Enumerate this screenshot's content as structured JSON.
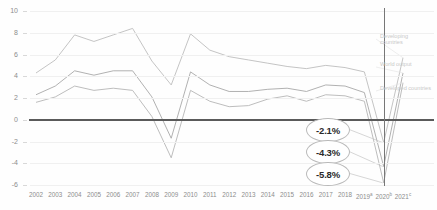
{
  "chart_data": {
    "type": "line",
    "title": "",
    "xlabel": "",
    "ylabel": "",
    "ylim": [
      -6,
      10
    ],
    "grid": true,
    "legend_position": "right",
    "categories": [
      "2002",
      "2003",
      "2004",
      "2005",
      "2006",
      "2007",
      "2008",
      "2009",
      "2010",
      "2011",
      "2012",
      "2013",
      "2014",
      "2015",
      "2016",
      "2017",
      "2018",
      "2019",
      "2020",
      "2021"
    ],
    "tick_labels": [
      "2002",
      "2003",
      "2004",
      "2005",
      "2006",
      "2007",
      "2008",
      "2009",
      "2010",
      "2011",
      "2012",
      "2013",
      "2014",
      "2015",
      "2016",
      "2017",
      "2018",
      "2019",
      "2020",
      "2021"
    ],
    "tick_superscripts": [
      "",
      "",
      "",
      "",
      "",
      "",
      "",
      "",
      "",
      "",
      "",
      "",
      "",
      "",
      "",
      "",
      "",
      "a",
      "b",
      "c"
    ],
    "yticks": [
      10,
      8,
      6,
      4,
      2,
      0,
      -2,
      -4,
      -6
    ],
    "series": [
      {
        "name": "Developing countries",
        "color": "#bdbdbd",
        "values": [
          4.3,
          5.5,
          7.8,
          7.2,
          7.8,
          8.4,
          5.4,
          3.2,
          7.9,
          6.4,
          5.8,
          5.5,
          5.2,
          4.9,
          4.7,
          5.0,
          4.8,
          4.4,
          -2.1,
          5.7
        ]
      },
      {
        "name": "World output",
        "color": "#a8a8a8",
        "values": [
          2.3,
          3.1,
          4.5,
          4.1,
          4.5,
          4.5,
          2.1,
          -1.7,
          4.4,
          3.2,
          2.6,
          2.6,
          2.8,
          2.9,
          2.6,
          3.2,
          3.1,
          2.5,
          -4.3,
          4.3
        ]
      },
      {
        "name": "Developed countries",
        "color": "#b5b5b5",
        "values": [
          1.6,
          2.1,
          3.1,
          2.7,
          2.9,
          2.7,
          0.3,
          -3.5,
          2.7,
          1.7,
          1.2,
          1.3,
          1.9,
          2.2,
          1.7,
          2.3,
          2.2,
          1.7,
          -5.8,
          3.4
        ]
      }
    ],
    "annotations": [
      {
        "label": "-2.1%",
        "series": "Developing countries",
        "year": "2020"
      },
      {
        "label": "-4.3%",
        "series": "World output",
        "year": "2020"
      },
      {
        "label": "-5.8%",
        "series": "Developed countries",
        "year": "2020"
      }
    ],
    "marker_line_year": "2020"
  },
  "legend": {
    "items": [
      {
        "label": "Developing countries"
      },
      {
        "label": "World output"
      },
      {
        "label": "Developed countries"
      }
    ]
  }
}
